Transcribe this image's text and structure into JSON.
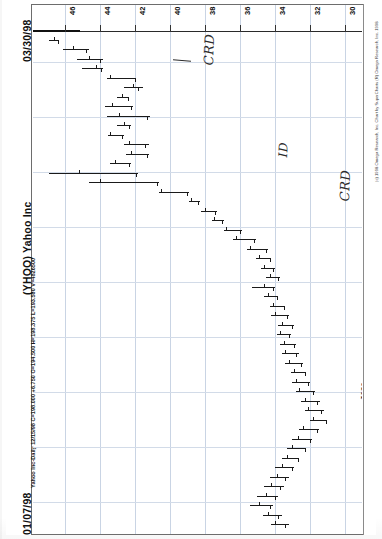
{
  "document": {
    "kind": "scanned-stock-chart",
    "orientation": "rotated-90-ccw",
    "date_top": "03/30/98",
    "date_bottom": "01/07/98",
    "title": "(YHOO) Yahoo Inc",
    "quote_line": "Yahoo Inc-Daily 12/15/98 C=198.000 +6.750 O=194.500 H=198.375 L=193.500 V=4826500",
    "copyright": "(c) 1998 Omega Research, Inc. Chart by SuperCharts (R) Omega Research, Inc. 1998"
  },
  "quote": {
    "symbol": "YHOO",
    "name": "Yahoo Inc",
    "interval": "Daily",
    "date": "12/15/98",
    "close_label": "C=198.000",
    "change_label": "+6.750",
    "open_label": "O=194.500",
    "high_label": "H=198.375",
    "low_label": "L=193.500",
    "volume_label": "V=4826500"
  },
  "chart_data": {
    "type": "ohlc",
    "title": "(YHOO) Yahoo Inc",
    "subtitle": "Yahoo Inc-Daily 12/15/98 C=198.000 +6.750 O=194.500 H=198.375 L=193.500 V=4826500",
    "xlabel": "",
    "ylabel": "",
    "grid": true,
    "legend": "none",
    "price_axis": {
      "position": "top",
      "ticks": [
        "46",
        "44",
        "42",
        "40",
        "38",
        "36",
        "34",
        "32",
        "30"
      ],
      "range": [
        30,
        47
      ]
    },
    "date_axis": {
      "position": "right",
      "ticks": [
        "23",
        "16",
        "9",
        "M",
        "23",
        "9",
        "F",
        "26",
        "12"
      ],
      "start": "01/07/98",
      "end": "03/30/98"
    },
    "bars": [
      {
        "o": 46.6,
        "h": 46.9,
        "l": 46.3,
        "c": 46.4
      },
      {
        "o": 45.5,
        "h": 46.1,
        "l": 44.6,
        "c": 44.8
      },
      {
        "o": 44.6,
        "h": 45.3,
        "l": 43.8,
        "c": 44.0
      },
      {
        "o": 44.2,
        "h": 45.0,
        "l": 43.8,
        "c": 43.9
      },
      {
        "o": 43.4,
        "h": 43.6,
        "l": 41.9,
        "c": 42.0
      },
      {
        "o": 42.1,
        "h": 42.6,
        "l": 41.5,
        "c": 41.8
      },
      {
        "o": 42.7,
        "h": 43.0,
        "l": 42.3,
        "c": 42.4
      },
      {
        "o": 43.3,
        "h": 43.7,
        "l": 42.1,
        "c": 42.2
      },
      {
        "o": 42.9,
        "h": 43.6,
        "l": 41.1,
        "c": 41.3
      },
      {
        "o": 42.6,
        "h": 43.0,
        "l": 42.2,
        "c": 42.3
      },
      {
        "o": 43.4,
        "h": 43.5,
        "l": 42.6,
        "c": 42.7
      },
      {
        "o": 42.3,
        "h": 42.6,
        "l": 41.2,
        "c": 41.4
      },
      {
        "o": 42.2,
        "h": 42.5,
        "l": 41.2,
        "c": 41.3
      },
      {
        "o": 43.1,
        "h": 43.4,
        "l": 42.2,
        "c": 42.3
      },
      {
        "o": 45.2,
        "h": 46.9,
        "l": 41.8,
        "c": 41.9
      },
      {
        "o": 44.0,
        "h": 44.6,
        "l": 40.6,
        "c": 40.7
      },
      {
        "o": 40.5,
        "h": 40.6,
        "l": 38.9,
        "c": 39.0
      },
      {
        "o": 38.8,
        "h": 38.9,
        "l": 38.3,
        "c": 38.4
      },
      {
        "o": 38.0,
        "h": 38.2,
        "l": 37.3,
        "c": 37.4
      },
      {
        "o": 37.5,
        "h": 37.6,
        "l": 36.9,
        "c": 37.0
      },
      {
        "o": 36.8,
        "h": 36.9,
        "l": 35.9,
        "c": 36.0
      },
      {
        "o": 36.2,
        "h": 36.4,
        "l": 35.1,
        "c": 35.2
      },
      {
        "o": 35.4,
        "h": 35.6,
        "l": 34.4,
        "c": 34.5
      },
      {
        "o": 34.9,
        "h": 35.1,
        "l": 34.2,
        "c": 34.3
      },
      {
        "o": 34.6,
        "h": 34.8,
        "l": 34.0,
        "c": 34.1
      },
      {
        "o": 34.3,
        "h": 34.5,
        "l": 33.7,
        "c": 33.8
      },
      {
        "o": 34.6,
        "h": 35.3,
        "l": 34.0,
        "c": 34.1
      },
      {
        "o": 34.4,
        "h": 34.6,
        "l": 33.8,
        "c": 33.9
      },
      {
        "o": 34.1,
        "h": 34.3,
        "l": 33.4,
        "c": 33.5
      },
      {
        "o": 34.0,
        "h": 34.2,
        "l": 33.2,
        "c": 33.3
      },
      {
        "o": 33.6,
        "h": 33.8,
        "l": 32.9,
        "c": 33.0
      },
      {
        "o": 33.7,
        "h": 33.9,
        "l": 33.1,
        "c": 33.2
      },
      {
        "o": 33.5,
        "h": 33.7,
        "l": 32.8,
        "c": 32.9
      },
      {
        "o": 33.4,
        "h": 33.6,
        "l": 32.6,
        "c": 32.8
      },
      {
        "o": 33.2,
        "h": 33.4,
        "l": 32.4,
        "c": 32.5
      },
      {
        "o": 32.9,
        "h": 33.1,
        "l": 32.2,
        "c": 32.3
      },
      {
        "o": 32.8,
        "h": 33.0,
        "l": 32.0,
        "c": 32.1
      },
      {
        "o": 32.6,
        "h": 32.8,
        "l": 31.7,
        "c": 31.8
      },
      {
        "o": 32.3,
        "h": 32.5,
        "l": 31.4,
        "c": 31.6
      },
      {
        "o": 32.1,
        "h": 32.3,
        "l": 31.2,
        "c": 31.4
      },
      {
        "o": 31.8,
        "h": 32.0,
        "l": 31.0,
        "c": 31.1
      },
      {
        "o": 32.4,
        "h": 32.6,
        "l": 31.5,
        "c": 31.6
      },
      {
        "o": 32.7,
        "h": 33.0,
        "l": 31.9,
        "c": 32.0
      },
      {
        "o": 33.0,
        "h": 33.3,
        "l": 32.2,
        "c": 32.3
      },
      {
        "o": 33.3,
        "h": 33.6,
        "l": 32.6,
        "c": 32.7
      },
      {
        "o": 33.6,
        "h": 34.0,
        "l": 32.9,
        "c": 33.0
      },
      {
        "o": 33.9,
        "h": 34.3,
        "l": 33.2,
        "c": 33.4
      },
      {
        "o": 34.2,
        "h": 34.6,
        "l": 33.5,
        "c": 33.7
      },
      {
        "o": 34.5,
        "h": 35.0,
        "l": 33.8,
        "c": 34.0
      },
      {
        "o": 34.9,
        "h": 35.4,
        "l": 34.1,
        "c": 34.3
      },
      {
        "o": 34.4,
        "h": 34.7,
        "l": 33.6,
        "c": 33.8
      },
      {
        "o": 34.0,
        "h": 34.2,
        "l": 33.2,
        "c": 33.4
      }
    ]
  },
  "annotations": [
    {
      "id": "crd-1",
      "text": "CRD"
    },
    {
      "id": "id-1",
      "text": "ID"
    },
    {
      "id": "crd-2",
      "text": "CRD"
    },
    {
      "id": "xx-1",
      "text": "XX"
    }
  ]
}
